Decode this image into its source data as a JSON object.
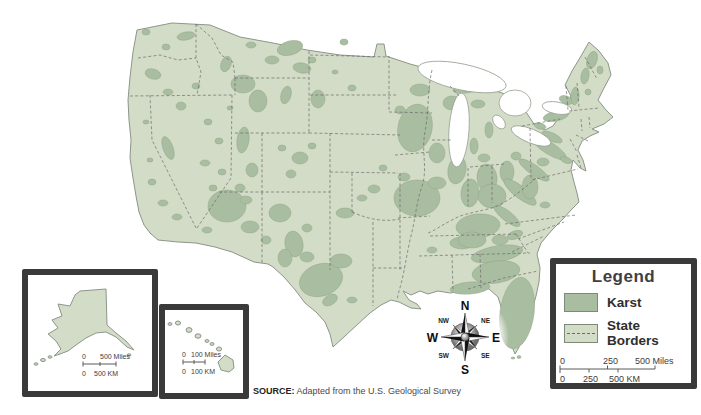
{
  "legend": {
    "title": "Legend",
    "items": [
      {
        "label": "Karst",
        "swatch_color": "#a9bda1"
      },
      {
        "label": "State Borders",
        "swatch_color": "#d3dcc6"
      }
    ],
    "scale": {
      "miles": [
        "0",
        "250",
        "500 Miles"
      ],
      "km": [
        "0",
        "250",
        "500 KM"
      ]
    }
  },
  "compass": {
    "n": "N",
    "e": "E",
    "s": "S",
    "w": "W",
    "nw": "NW",
    "ne": "NE",
    "sw": "SW",
    "se": "SE"
  },
  "insets": {
    "alaska": {
      "scale": {
        "miles": [
          "0",
          "500 Miles"
        ],
        "km": [
          "0",
          "500 KM"
        ]
      }
    },
    "hawaii": {
      "scale": {
        "miles": [
          "0",
          "100 Miles"
        ],
        "km": [
          "0",
          "100 KM"
        ]
      }
    }
  },
  "source": {
    "prefix": "SOURCE:",
    "text": "Adapted from the U.S. Geological Survey"
  },
  "colors": {
    "karst": "#a9bda1",
    "land": "#d3dcc6",
    "frame": "#3a3a3a"
  }
}
